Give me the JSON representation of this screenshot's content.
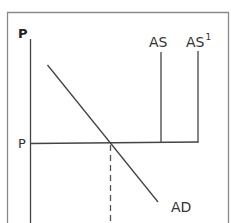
{
  "diagram": {
    "colors": {
      "frame": "#8a8a8a",
      "line": "#444444",
      "text": "#333333",
      "background": "#ffffff"
    },
    "labels": {
      "y_axis": "P",
      "price_level": "P",
      "as": "AS",
      "as1_base": "AS",
      "as1_superscript": "1",
      "ad": "AD"
    },
    "curves": [
      {
        "name": "AS",
        "type": "vertical",
        "x": 161
      },
      {
        "name": "AS1",
        "type": "vertical",
        "x": 198
      },
      {
        "name": "AD",
        "type": "downward-sloping"
      },
      {
        "name": "P",
        "type": "horizontal price line"
      },
      {
        "name": "output-at-P",
        "type": "dashed vertical"
      }
    ]
  }
}
